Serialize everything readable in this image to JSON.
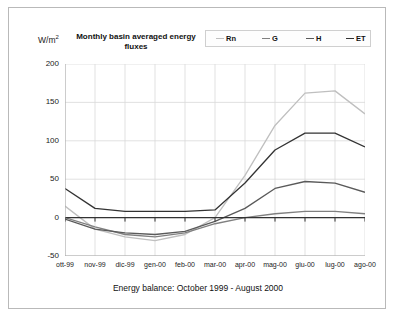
{
  "figure": {
    "yaxis_unit_main": "W/m",
    "yaxis_unit_exp": "2",
    "title": "Monthly basin averaged energy fluxes",
    "caption": "Energy balance: October 1999 - August 2000"
  },
  "legend": {
    "items": [
      {
        "label": "Rn",
        "color": "#bfbfbf"
      },
      {
        "label": "G",
        "color": "#808080"
      },
      {
        "label": "H",
        "color": "#5a5a5a"
      },
      {
        "label": "ET",
        "color": "#333333"
      }
    ]
  },
  "colors": {
    "grid": "#d9d9d9",
    "axis": "#a8a8a8",
    "zero_line": "#333333",
    "frame": "#b9b9b9",
    "text": "#111111"
  },
  "chart_data": {
    "type": "line",
    "title": "Monthly basin averaged energy fluxes",
    "xlabel": "",
    "ylabel": "W/m2",
    "ylim": [
      -50,
      200
    ],
    "yticks": [
      200,
      150,
      100,
      50,
      0,
      -50
    ],
    "grid": true,
    "legend_position": "top-right",
    "annotations": [
      "Energy balance: October 1999 - August 2000"
    ],
    "categories": [
      "ott-99",
      "nov-99",
      "dic-99",
      "gen-00",
      "feb-00",
      "mar-00",
      "apr-00",
      "mag-00",
      "giu-00",
      "lug-00",
      "ago-00"
    ],
    "series": [
      {
        "name": "Rn",
        "color": "#bfbfbf",
        "values": [
          15,
          -15,
          -25,
          -30,
          -22,
          0,
          55,
          120,
          162,
          165,
          135
        ]
      },
      {
        "name": "G",
        "color": "#808080",
        "values": [
          0,
          -12,
          -22,
          -25,
          -20,
          -8,
          0,
          5,
          8,
          8,
          5
        ]
      },
      {
        "name": "H",
        "color": "#5a5a5a",
        "values": [
          -2,
          -15,
          -20,
          -22,
          -18,
          -5,
          12,
          38,
          47,
          45,
          33
        ]
      },
      {
        "name": "ET",
        "color": "#333333",
        "values": [
          38,
          12,
          8,
          8,
          8,
          10,
          45,
          88,
          110,
          110,
          92
        ]
      }
    ]
  }
}
